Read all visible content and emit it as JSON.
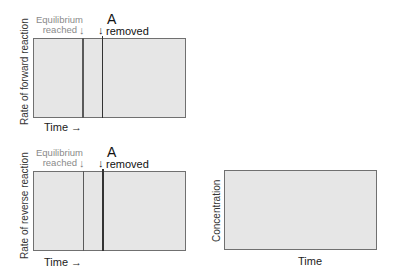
{
  "panels": [
    {
      "id": "forward",
      "ylabel": "Rate of forward reaction",
      "xlabel": "Time →",
      "annotations": {
        "equilibrium_line1": "Equilibrium",
        "equilibrium_line2": "reached",
        "equilibrium_arrow": "↓",
        "event_letter": "A",
        "event_text": "removed",
        "event_arrow": "↓"
      }
    },
    {
      "id": "reverse",
      "ylabel": "Rate of reverse reaction",
      "xlabel": "Time →",
      "annotations": {
        "equilibrium_line1": "Equilibrium",
        "equilibrium_line2": "reached",
        "equilibrium_arrow": "↓",
        "event_letter": "A",
        "event_text": "removed",
        "event_arrow": "↓"
      }
    },
    {
      "id": "concentration",
      "ylabel": "Concentration",
      "xlabel": "Time"
    }
  ],
  "colors": {
    "plot_fill": "#e6e6e6",
    "plot_border": "#707070",
    "equilibrium_text": "#8a8a8a"
  }
}
